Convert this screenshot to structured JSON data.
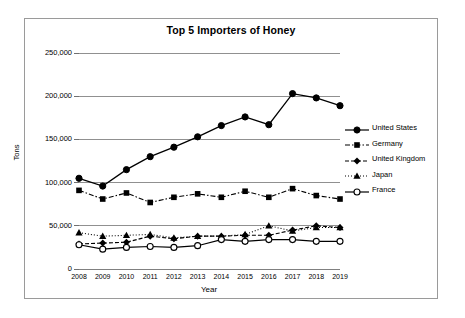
{
  "chart_data": {
    "type": "line",
    "title": "Top 5 Importers of Honey",
    "xlabel": "Year",
    "ylabel": "Tons",
    "categories": [
      "2008",
      "2009",
      "2010",
      "2011",
      "2012",
      "2013",
      "2014",
      "2015",
      "2016",
      "2017",
      "2018",
      "2019"
    ],
    "x": [
      2008,
      2009,
      2010,
      2011,
      2012,
      2013,
      2014,
      2015,
      2016,
      2017,
      2018,
      2019
    ],
    "ylim": [
      0,
      250000
    ],
    "xlim": [
      2008,
      2019
    ],
    "ytick_labels": [
      "0",
      "50,000",
      "100,000",
      "150,000",
      "200,000",
      "250,000"
    ],
    "ytick_values": [
      0,
      50000,
      100000,
      150000,
      200000,
      250000
    ],
    "grid": "horizontal",
    "legend_position": "right",
    "series": [
      {
        "name": "United States",
        "marker": "filled-circle",
        "line_style": "solid",
        "color": "#000000",
        "values": [
          105000,
          96000,
          115000,
          130000,
          141000,
          153000,
          166000,
          176000,
          167000,
          203000,
          198000,
          189000
        ]
      },
      {
        "name": "Germany",
        "marker": "filled-square",
        "line_style": "dash-dot",
        "color": "#000000",
        "values": [
          91000,
          81000,
          88000,
          77000,
          83000,
          87000,
          83000,
          90000,
          83000,
          93000,
          85000,
          81000
        ]
      },
      {
        "name": "United Kingdom",
        "marker": "filled-diamond",
        "line_style": "dashed",
        "color": "#000000",
        "values": [
          29000,
          30000,
          31000,
          38000,
          35000,
          38000,
          38000,
          39000,
          39000,
          45000,
          50000,
          48000
        ]
      },
      {
        "name": "Japan",
        "marker": "filled-triangle",
        "line_style": "dotted",
        "color": "#000000",
        "values": [
          42000,
          38000,
          39000,
          40000,
          36000,
          38000,
          38000,
          40000,
          50000,
          44000,
          48000,
          48000
        ]
      },
      {
        "name": "France",
        "marker": "open-circle",
        "line_style": "solid",
        "color": "#000000",
        "values": [
          28000,
          23000,
          25000,
          26000,
          25000,
          27000,
          34000,
          32000,
          34000,
          34000,
          32000,
          32000
        ]
      }
    ]
  },
  "legend": {
    "entries": [
      {
        "label": "United States"
      },
      {
        "label": "Germany"
      },
      {
        "label": "United Kingdom"
      },
      {
        "label": "Japan"
      },
      {
        "label": "France"
      }
    ]
  }
}
